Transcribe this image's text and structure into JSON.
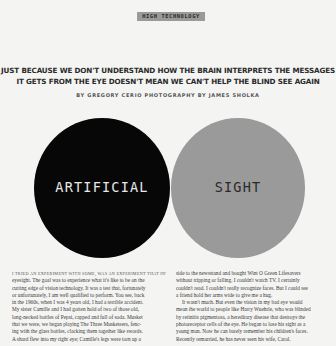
{
  "section_label": "HIGH TECHNOLOGY",
  "headline": {
    "line1": "JUST BECAUSE WE DON'T UNDERSTAND HOW THE BRAIN INTERPRETS THE MESSAGES",
    "line2": "IT GETS FROM THE EYE DOESN'T MEAN WE CAN'T HELP THE BLIND SEE AGAIN"
  },
  "byline": "BY GREGORY CERIO   PHOTOGRAPHY BY JAMES SHOLKA",
  "circles": {
    "left": {
      "label": "ARTIFICIAL",
      "color": "#070707"
    },
    "right": {
      "label": "SIGHT",
      "color": "#9a9a9a"
    }
  },
  "body": {
    "left_column": [
      "I TRIED AN EXPERIMENT WITH SOME, WAS AN EXPERIMENT THAT INVOLVED",
      "eyesight. The goal was to experience what it's like to be on the",
      "cutting edge of vision technology. It was a test that, fortunately",
      "or unfortunately, I am well qualified to perform. You see, back",
      "in the 1960s, when I was 4 years old, I had a terrible accident.",
      "My sister Camille and I had gotten hold of two of those old,",
      "long-necked bottles of Pepsi, capped and full of soda. Musket",
      "that we were, we began playing The Three Musketeers, fenc-",
      "ing with the glass bottles, clacking them together like swords.",
      "A shard flew into my right eye; Camille's legs were torn up a"
    ],
    "right_column": [
      "side to the newsstand and bought Wint O Green Lifesavers",
      "without tripping or falling. I couldn't watch TV. I certainly",
      "couldn't read. I couldn't really recognize faces. But I could see",
      "a friend hold her arms wide to give me a hug.",
      "It wasn't much. But even the vision in my bad eye would",
      "mean the world to people like Harry Wuehrle, who was blinded",
      "by retinitis pigmentosa, a hereditary disease that destroys the",
      "photoreceptor cells of the eye. He began to lose his sight as a",
      "young man. Now he can barely remember his children's faces.",
      "Recently remarried, he has never seen his wife, Carol."
    ]
  }
}
